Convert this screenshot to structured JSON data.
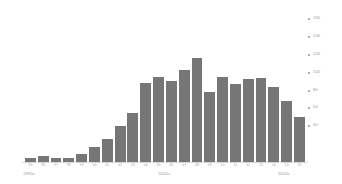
{
  "chart_data": {
    "type": "bar",
    "title": "",
    "subtitle": "",
    "xlabel": "",
    "ylabel": "",
    "ylim": [
      0,
      168
    ],
    "grid": false,
    "legend": "none",
    "bar_color": "#767676",
    "axis_text_color": "#9a9a9a",
    "background": "#ffffff",
    "categories": [
      "95",
      "96",
      "97",
      "98",
      "99",
      "00",
      "01",
      "02",
      "03",
      "04",
      "05",
      "06",
      "07",
      "08",
      "09",
      "10",
      "11",
      "12",
      "13",
      "14",
      "15",
      "16"
    ],
    "values": [
      4,
      7,
      4,
      4,
      9,
      17,
      26,
      40,
      55,
      89,
      95,
      91,
      103,
      117,
      78,
      95,
      87,
      93,
      94,
      84,
      68,
      50
    ],
    "yticks": [
      40,
      60,
      80,
      100,
      120,
      140,
      160
    ],
    "ytick_labels": [
      "40",
      "60",
      "80",
      "100",
      "120",
      "140",
      "160"
    ],
    "decade_groups": [
      {
        "label": "1990s",
        "center_pct": 8.5
      },
      {
        "label": "2000s",
        "center_pct": 48.0
      },
      {
        "label": "2010s",
        "center_pct": 83.0
      }
    ]
  }
}
